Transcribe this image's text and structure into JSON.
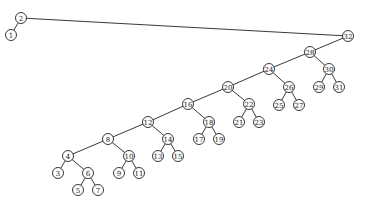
{
  "diagram": {
    "type": "binary-search-tree",
    "root": "2",
    "nodes": [
      {
        "id": "2",
        "label": "2",
        "x": 21,
        "y": 18
      },
      {
        "id": "1",
        "label": "1",
        "x": 11,
        "y": 35
      },
      {
        "id": "32",
        "label": "32",
        "x": 348,
        "y": 36
      },
      {
        "id": "28",
        "label": "28",
        "x": 310,
        "y": 52
      },
      {
        "id": "30",
        "label": "30",
        "x": 329,
        "y": 69
      },
      {
        "id": "29",
        "label": "29",
        "x": 319,
        "y": 87
      },
      {
        "id": "31",
        "label": "31",
        "x": 339,
        "y": 87
      },
      {
        "id": "24",
        "label": "24",
        "x": 269,
        "y": 69
      },
      {
        "id": "20",
        "label": "20",
        "x": 228,
        "y": 87
      },
      {
        "id": "26",
        "label": "26",
        "x": 289,
        "y": 87
      },
      {
        "id": "25",
        "label": "25",
        "x": 279,
        "y": 105
      },
      {
        "id": "27",
        "label": "27",
        "x": 299,
        "y": 105
      },
      {
        "id": "16",
        "label": "16",
        "x": 188,
        "y": 104
      },
      {
        "id": "22",
        "label": "22",
        "x": 249,
        "y": 104
      },
      {
        "id": "21",
        "label": "21",
        "x": 239,
        "y": 122
      },
      {
        "id": "23",
        "label": "23",
        "x": 259,
        "y": 122
      },
      {
        "id": "12",
        "label": "12",
        "x": 148,
        "y": 122
      },
      {
        "id": "18",
        "label": "18",
        "x": 209,
        "y": 122
      },
      {
        "id": "17",
        "label": "17",
        "x": 199,
        "y": 139
      },
      {
        "id": "19",
        "label": "19",
        "x": 219,
        "y": 139
      },
      {
        "id": "8",
        "label": "8",
        "x": 108,
        "y": 139
      },
      {
        "id": "14",
        "label": "14",
        "x": 168,
        "y": 139
      },
      {
        "id": "13",
        "label": "13",
        "x": 158,
        "y": 156
      },
      {
        "id": "15",
        "label": "15",
        "x": 178,
        "y": 156
      },
      {
        "id": "4",
        "label": "4",
        "x": 68,
        "y": 156
      },
      {
        "id": "10",
        "label": "10",
        "x": 129,
        "y": 156
      },
      {
        "id": "3",
        "label": "3",
        "x": 58,
        "y": 173
      },
      {
        "id": "6",
        "label": "6",
        "x": 88,
        "y": 173
      },
      {
        "id": "9",
        "label": "9",
        "x": 119,
        "y": 173
      },
      {
        "id": "11",
        "label": "11",
        "x": 139,
        "y": 173
      },
      {
        "id": "5",
        "label": "5",
        "x": 78,
        "y": 190
      },
      {
        "id": "7",
        "label": "7",
        "x": 98,
        "y": 190
      }
    ],
    "edges": [
      [
        "2",
        "1"
      ],
      [
        "2",
        "32"
      ],
      [
        "32",
        "28"
      ],
      [
        "28",
        "24"
      ],
      [
        "28",
        "30"
      ],
      [
        "30",
        "29"
      ],
      [
        "30",
        "31"
      ],
      [
        "24",
        "20"
      ],
      [
        "24",
        "26"
      ],
      [
        "26",
        "25"
      ],
      [
        "26",
        "27"
      ],
      [
        "20",
        "16"
      ],
      [
        "20",
        "22"
      ],
      [
        "22",
        "21"
      ],
      [
        "22",
        "23"
      ],
      [
        "16",
        "12"
      ],
      [
        "16",
        "18"
      ],
      [
        "18",
        "17"
      ],
      [
        "18",
        "19"
      ],
      [
        "12",
        "8"
      ],
      [
        "12",
        "14"
      ],
      [
        "14",
        "13"
      ],
      [
        "14",
        "15"
      ],
      [
        "8",
        "4"
      ],
      [
        "8",
        "10"
      ],
      [
        "4",
        "3"
      ],
      [
        "4",
        "6"
      ],
      [
        "6",
        "5"
      ],
      [
        "6",
        "7"
      ],
      [
        "10",
        "9"
      ],
      [
        "10",
        "11"
      ]
    ],
    "colors": {
      "stroke": "#222222",
      "fill": "#ffffff",
      "background": "#ffffff"
    }
  }
}
